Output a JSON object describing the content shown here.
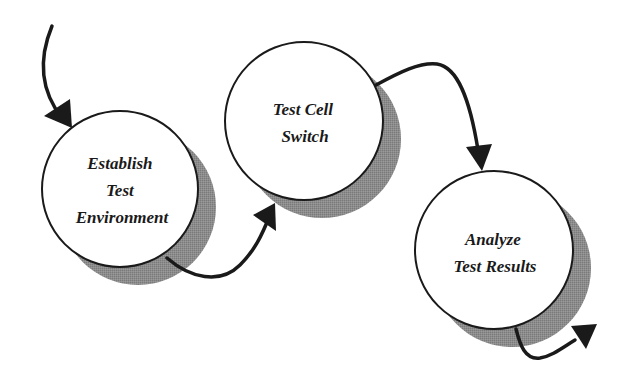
{
  "diagram": {
    "type": "process-flow",
    "colors": {
      "background": "#ffffff",
      "circle_fill": "#ffffff",
      "circle_stroke": "#1a1a1a",
      "shadow": "#8c8c8c",
      "arrow": "#1a1a1a",
      "text": "#1a1a1a"
    },
    "nodes": [
      {
        "id": "establish",
        "lines": [
          "Establish",
          "Test",
          "Environment"
        ]
      },
      {
        "id": "switch",
        "lines": [
          "Test Cell",
          "Switch"
        ]
      },
      {
        "id": "analyze",
        "lines": [
          "Analyze",
          "Test Results"
        ]
      }
    ],
    "edges": [
      {
        "from": "start",
        "to": "establish"
      },
      {
        "from": "establish",
        "to": "switch"
      },
      {
        "from": "switch",
        "to": "analyze"
      },
      {
        "from": "analyze",
        "to": "end"
      }
    ]
  }
}
